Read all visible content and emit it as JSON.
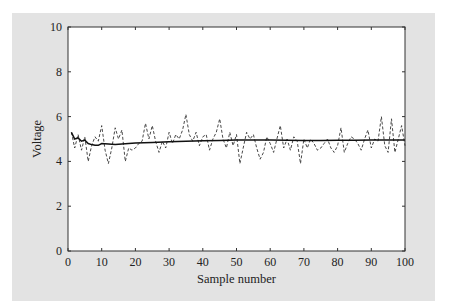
{
  "chart_data": {
    "type": "line",
    "title": "",
    "xlabel": "Sample number",
    "ylabel": "Voltage",
    "xlim": [
      0,
      100
    ],
    "ylim": [
      0,
      10
    ],
    "xticks": [
      0,
      10,
      20,
      30,
      40,
      50,
      60,
      70,
      80,
      90,
      100
    ],
    "yticks": [
      0,
      2,
      4,
      6,
      8,
      10
    ],
    "grid": false,
    "legend": null,
    "series": [
      {
        "name": "noisy measurement",
        "style": "dashed",
        "color": "#333333",
        "x": [
          1,
          2,
          3,
          4,
          5,
          6,
          7,
          8,
          9,
          10,
          11,
          12,
          13,
          14,
          15,
          16,
          17,
          18,
          19,
          20,
          21,
          22,
          23,
          24,
          25,
          26,
          27,
          28,
          29,
          30,
          31,
          32,
          33,
          34,
          35,
          36,
          37,
          38,
          39,
          40,
          41,
          42,
          43,
          44,
          45,
          46,
          47,
          48,
          49,
          50,
          51,
          52,
          53,
          54,
          55,
          56,
          57,
          58,
          59,
          60,
          61,
          62,
          63,
          64,
          65,
          66,
          67,
          68,
          69,
          70,
          71,
          72,
          73,
          74,
          75,
          76,
          77,
          78,
          79,
          80,
          81,
          82,
          83,
          84,
          85,
          86,
          87,
          88,
          89,
          90,
          91,
          92,
          93,
          94,
          95,
          96,
          97,
          98,
          99,
          100
        ],
        "values": [
          5.3,
          4.6,
          5.2,
          4.5,
          5.1,
          4.0,
          4.7,
          5.1,
          4.9,
          5.6,
          4.5,
          3.9,
          4.6,
          5.5,
          5.0,
          5.4,
          4.0,
          4.6,
          4.5,
          4.6,
          4.8,
          4.9,
          5.7,
          5.0,
          5.6,
          4.9,
          4.4,
          4.9,
          4.6,
          5.3,
          4.8,
          5.2,
          5.0,
          5.4,
          6.1,
          5.2,
          4.9,
          5.3,
          4.7,
          5.1,
          5.2,
          4.5,
          5.0,
          5.3,
          5.9,
          5.0,
          4.6,
          5.3,
          4.7,
          5.2,
          3.9,
          4.6,
          5.3,
          5.0,
          5.2,
          4.6,
          4.1,
          4.4,
          5.1,
          4.8,
          4.4,
          5.0,
          5.6,
          4.6,
          5.0,
          4.5,
          5.1,
          4.9,
          3.9,
          5.0,
          4.6,
          5.0,
          4.8,
          4.5,
          4.6,
          4.8,
          5.0,
          4.6,
          4.4,
          4.7,
          5.5,
          4.4,
          4.8,
          5.1,
          5.0,
          4.8,
          4.5,
          5.0,
          5.4,
          4.6,
          5.0,
          4.9,
          6.0,
          4.7,
          4.4,
          5.9,
          4.4,
          5.0,
          5.6,
          4.7
        ]
      },
      {
        "name": "filtered estimate",
        "style": "solid",
        "color": "#111111",
        "x": [
          1,
          2,
          3,
          4,
          5,
          6,
          7,
          8,
          9,
          10,
          12,
          14,
          16,
          18,
          20,
          25,
          30,
          35,
          40,
          45,
          50,
          55,
          60,
          65,
          70,
          75,
          80,
          85,
          90,
          95,
          100
        ],
        "values": [
          5.3,
          5.0,
          5.05,
          4.9,
          4.95,
          4.8,
          4.75,
          4.72,
          4.72,
          4.8,
          4.78,
          4.76,
          4.78,
          4.8,
          4.82,
          4.85,
          4.88,
          4.9,
          4.92,
          4.93,
          4.95,
          4.96,
          4.95,
          4.94,
          4.93,
          4.93,
          4.94,
          4.94,
          4.95,
          4.95,
          4.95
        ]
      }
    ]
  }
}
